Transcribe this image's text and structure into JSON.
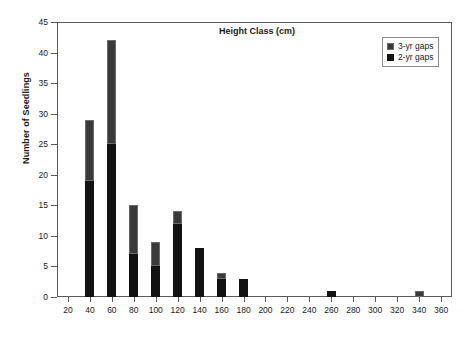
{
  "chart_data": {
    "type": "bar",
    "subtype": "stacked-bar",
    "title": "",
    "xlabel": "Height Class (cm)",
    "ylabel": "Number of Seedlings",
    "categories": [
      20,
      40,
      60,
      80,
      100,
      120,
      140,
      160,
      180,
      200,
      220,
      240,
      260,
      280,
      300,
      320,
      340,
      360
    ],
    "xtick_labels": [
      "20",
      "40",
      "60",
      "80",
      "100",
      "120",
      "140",
      "160",
      "180",
      "200",
      "220",
      "240",
      "260",
      "280",
      "300",
      "320",
      "340",
      "360"
    ],
    "ytick_labels": [
      "0",
      "5",
      "10",
      "15",
      "20",
      "25",
      "30",
      "35",
      "40",
      "45"
    ],
    "xlim": [
      10,
      370
    ],
    "ylim": [
      0,
      45
    ],
    "ytick_step": 5,
    "grid": false,
    "legend_position": "top-right",
    "series": [
      {
        "name": "2-yr gaps",
        "fill": "solid-black",
        "color": "#121212",
        "values": [
          0,
          19,
          25,
          7,
          5,
          12,
          8,
          3,
          3,
          0,
          0,
          0,
          1,
          0,
          0,
          0,
          0,
          0
        ]
      },
      {
        "name": "3-yr gaps",
        "fill": "hatched",
        "color": "#3a3a3a",
        "values": [
          0,
          10,
          17,
          8,
          4,
          2,
          0,
          1,
          0,
          0,
          0,
          0,
          0,
          0,
          0,
          0,
          1,
          0
        ]
      }
    ],
    "totals": [
      0,
      29,
      42,
      15,
      9,
      14,
      8,
      4,
      3,
      0,
      0,
      0,
      1,
      0,
      0,
      0,
      1,
      0
    ]
  },
  "legend": {
    "items": [
      {
        "label": "3-yr gaps",
        "swatch": "hatched"
      },
      {
        "label": "2-yr gaps",
        "swatch": "solid"
      }
    ]
  }
}
